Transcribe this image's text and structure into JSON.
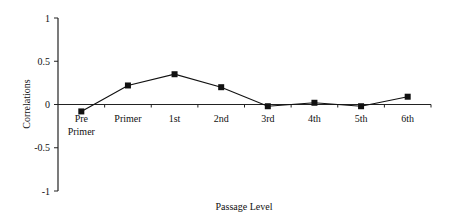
{
  "chart_data": {
    "type": "line",
    "title": "",
    "xlabel": "Passage Level",
    "ylabel": "Correlations",
    "categories": [
      "Pre Primer",
      "Primer",
      "1st",
      "2nd",
      "3rd",
      "4th",
      "5th",
      "6th"
    ],
    "category_lines": [
      [
        "Pre",
        "Primer"
      ],
      [
        "Primer"
      ],
      [
        "1st"
      ],
      [
        "2nd"
      ],
      [
        "3rd"
      ],
      [
        "4th"
      ],
      [
        "5th"
      ],
      [
        "6th"
      ]
    ],
    "series": [
      {
        "name": "Correlations",
        "values": [
          -0.08,
          0.22,
          0.35,
          0.2,
          -0.02,
          0.02,
          -0.02,
          0.09
        ],
        "marker": "square",
        "color": "#111111"
      }
    ],
    "ylim": [
      -1,
      1
    ],
    "yticks": [
      1,
      0.5,
      0,
      -0.5,
      -1
    ],
    "ytick_labels": [
      "1",
      "0.5",
      "0",
      "-0.5",
      "-1"
    ],
    "grid": false,
    "legend": null
  }
}
